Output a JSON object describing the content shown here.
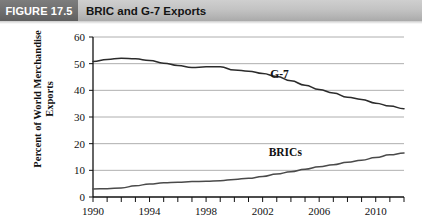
{
  "header": {
    "figure_tag": "FIGURE 17.5",
    "title": "BRIC and G-7 Exports"
  },
  "chart_data": {
    "type": "line",
    "title": "BRIC and G-7 Exports",
    "xlabel": "",
    "ylabel": "Percent of World Merchandise Exports",
    "xlim": [
      1990,
      2012
    ],
    "ylim": [
      0,
      60
    ],
    "ytick_labels": [
      "0",
      "10",
      "20",
      "30",
      "40",
      "50",
      "60"
    ],
    "yticks": [
      0,
      10,
      20,
      30,
      40,
      50,
      60
    ],
    "xtick_labels": [
      "1990",
      "1994",
      "1998",
      "2002",
      "2006",
      "2010"
    ],
    "xticks": [
      1990,
      1994,
      1998,
      2002,
      2006,
      2010
    ],
    "minor_xticks_every": 1,
    "grid": "horizontal",
    "legend_position": "inline-annotation",
    "x": [
      1990,
      1991,
      1992,
      1993,
      1994,
      1995,
      1996,
      1997,
      1998,
      1999,
      2000,
      2001,
      2002,
      2003,
      2004,
      2005,
      2006,
      2007,
      2008,
      2009,
      2010,
      2011,
      2012
    ],
    "series": [
      {
        "name": "G-7",
        "label": "G-7",
        "color": "#2b2b2b",
        "values": [
          50.8,
          51.6,
          52.0,
          51.8,
          51.2,
          50.2,
          49.3,
          48.6,
          48.8,
          48.8,
          47.6,
          47.2,
          46.3,
          45.2,
          43.6,
          41.9,
          40.3,
          39.0,
          37.4,
          36.6,
          35.2,
          34.1,
          33.1
        ]
      },
      {
        "name": "BRICs",
        "label": "BRICs",
        "color": "#4a4a4a",
        "values": [
          3.0,
          3.1,
          3.4,
          4.2,
          4.9,
          5.3,
          5.5,
          5.8,
          5.9,
          6.1,
          6.6,
          7.0,
          7.7,
          8.6,
          9.5,
          10.4,
          11.3,
          12.1,
          13.0,
          13.8,
          14.8,
          15.8,
          16.5
        ]
      }
    ],
    "annotations": [
      {
        "text": "G-7",
        "x": 2003.2,
        "y": 44.5
      },
      {
        "text": "BRICs",
        "x": 2003.6,
        "y": 15.5
      }
    ]
  }
}
